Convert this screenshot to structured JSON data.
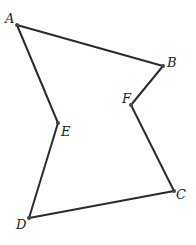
{
  "figure": {
    "type": "polygon",
    "vertices": [
      {
        "name": "A",
        "x": 17,
        "y": 25,
        "label_x": 5,
        "label_y": 23
      },
      {
        "name": "B",
        "x": 163,
        "y": 66,
        "label_x": 167,
        "label_y": 67
      },
      {
        "name": "C",
        "x": 174,
        "y": 191,
        "label_x": 176,
        "label_y": 199
      },
      {
        "name": "D",
        "x": 29,
        "y": 218,
        "label_x": 16,
        "label_y": 229
      },
      {
        "name": "E",
        "x": 58,
        "y": 123,
        "label_x": 61,
        "label_y": 136
      },
      {
        "name": "F",
        "x": 131,
        "y": 105,
        "label_x": 122,
        "label_y": 103
      }
    ],
    "edges": [
      [
        "A",
        "B"
      ],
      [
        "B",
        "F"
      ],
      [
        "F",
        "C"
      ],
      [
        "C",
        "D"
      ],
      [
        "D",
        "E"
      ],
      [
        "E",
        "A"
      ]
    ],
    "colors": {
      "stroke": "#2b2b2b",
      "vertex": "#444444",
      "label": "#222222"
    }
  }
}
